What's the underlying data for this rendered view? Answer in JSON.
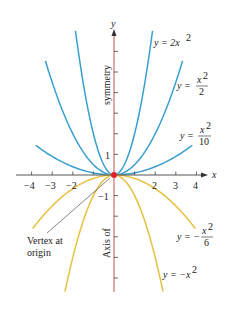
{
  "chart_data": {
    "type": "line",
    "title": "",
    "xlabel": "x",
    "ylabel": "y",
    "xlim": [
      -4.3,
      4.5
    ],
    "ylim": [
      -5.7,
      7.0
    ],
    "grid": false,
    "x_ticks": [
      -4,
      -3,
      -2,
      -1,
      0,
      1,
      2,
      3,
      4
    ],
    "x_tick_labels": [
      "-4",
      "-3",
      "-2",
      "",
      "",
      "",
      "2",
      "3",
      "4"
    ],
    "y_ticks": [
      -5,
      -4,
      -3,
      -2,
      -1,
      1,
      2,
      3,
      4,
      5,
      6
    ],
    "y_tick_labels": {
      "1": "1",
      "-1": "-1"
    },
    "axis_annotations": {
      "upper": "symmetry",
      "lower": "Axis of"
    },
    "vertex_annotation": {
      "lines": [
        "Vertex at",
        "origin"
      ],
      "point": [
        0,
        0
      ]
    },
    "series": [
      {
        "name": "y = 2x^2",
        "a": 2,
        "color": "#3a9fd0",
        "x_range": [
          -1.87,
          1.87
        ]
      },
      {
        "name": "y = x^2/2",
        "a": 0.5,
        "color": "#3a9fd0",
        "x_range": [
          -3.33,
          3.33
        ]
      },
      {
        "name": "y = x^2/10",
        "a": 0.1,
        "color": "#3a9fd0",
        "x_range": [
          -3.8,
          3.8
        ]
      },
      {
        "name": "y = -x^2/6",
        "a": -0.1667,
        "color": "#e8c040",
        "x_range": [
          -3.95,
          3.95
        ]
      },
      {
        "name": "y = -x^2",
        "a": -1,
        "color": "#e8c040",
        "x_range": [
          -2.38,
          2.38
        ]
      }
    ],
    "axis_color": "#c0504d",
    "vertex_color": "#e0202a"
  },
  "labels": {
    "y_axis": "y",
    "x_axis": "x",
    "tick_1": "1",
    "tick_neg1": "−1",
    "xt_m4": "−4",
    "xt_m3": "−3",
    "xt_m2": "−2",
    "xt_2": "2",
    "xt_3": "3",
    "xt_4": "4",
    "symmetry": "symmetry",
    "axis_of": "Axis of",
    "vertex_line1": "Vertex at",
    "vertex_line2": "origin",
    "c1_lhs": "y = 2x",
    "c1_exp": "2",
    "c2_lhs": "y =",
    "c2_num": "x",
    "c2_exp": "2",
    "c2_den": "2",
    "c3_lhs": "y =",
    "c3_num": "x",
    "c3_exp": "2",
    "c3_den": "10",
    "c4_lhs": "y = −",
    "c4_num": "x",
    "c4_exp": "2",
    "c4_den": "6",
    "c5_lhs": "y = −x",
    "c5_exp": "2"
  }
}
